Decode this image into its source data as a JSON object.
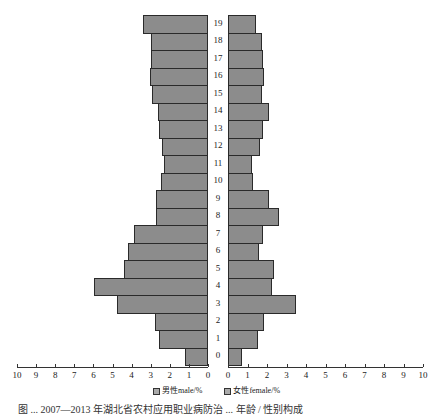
{
  "chart_data": {
    "type": "bar",
    "orientation": "horizontal-population-pyramid",
    "title": "",
    "categories": [
      "0",
      "1",
      "2",
      "3",
      "4",
      "5",
      "6",
      "7",
      "8",
      "9",
      "10",
      "11",
      "12",
      "13",
      "14",
      "15",
      "16",
      "17",
      "18",
      "19"
    ],
    "series": [
      {
        "name": "男性male/%",
        "side": "left",
        "values": [
          1.2,
          2.55,
          2.8,
          4.75,
          5.95,
          4.4,
          4.2,
          3.9,
          2.7,
          2.7,
          2.45,
          2.3,
          2.4,
          2.55,
          2.6,
          2.95,
          3.05,
          3.0,
          3.0,
          3.4
        ]
      },
      {
        "name": "女性female/%",
        "side": "right",
        "values": [
          0.7,
          1.55,
          1.85,
          3.5,
          2.25,
          2.35,
          1.6,
          1.8,
          2.6,
          2.1,
          1.3,
          1.25,
          1.65,
          1.8,
          2.1,
          1.75,
          1.85,
          1.8,
          1.75,
          1.45
        ]
      }
    ],
    "xlabel": "",
    "ylabel": "",
    "xlim_left": [
      10,
      0
    ],
    "xlim_right": [
      0,
      10
    ],
    "left_ticks": [
      "10",
      "9",
      "8",
      "7",
      "6",
      "5",
      "4",
      "3",
      "2",
      "1",
      "0"
    ],
    "right_ticks": [
      "0",
      "1",
      "2",
      "3",
      "4",
      "5",
      "6",
      "7",
      "8",
      "9",
      "10"
    ],
    "legend": [
      "男性male/%",
      "女性female/%"
    ],
    "legend_position": "bottom",
    "grid": false,
    "colors": {
      "bar_fill": "#8c8c8c",
      "bar_border": "#2a2a2a"
    }
  },
  "legend": {
    "male": "男性male/%",
    "female": "女性female/%"
  },
  "caption": "图 ... 2007—2013 年湖北省农村应用职业病防治 ... 年龄 / 性别构成"
}
